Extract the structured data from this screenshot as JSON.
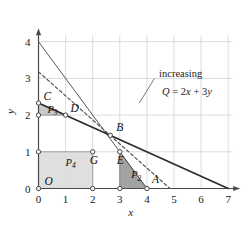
{
  "figure": {
    "kind": "linear-programming-feasible-region",
    "background_color": "#ffffff",
    "grid_color": "#c8cfd6",
    "line_color": "#3d3d3d",
    "dashed_color": "#4a4a4a"
  },
  "axes": {
    "x_label": "x",
    "y_label": "y",
    "x_ticks": [
      "0",
      "1",
      "2",
      "3",
      "4",
      "5",
      "6",
      "7"
    ],
    "y_ticks": [
      "0",
      "1",
      "2",
      "3",
      "4"
    ],
    "xlim": [
      0,
      7.25
    ],
    "ylim": [
      0,
      4.25
    ]
  },
  "points": [
    {
      "name": "O",
      "label": "O",
      "x": 0,
      "y": 0,
      "label_dx": 6,
      "label_dy": -4
    },
    {
      "name": "A",
      "label": "A",
      "x": 4,
      "y": 0,
      "label_dx": 5,
      "label_dy": -6
    },
    {
      "name": "B",
      "label": "B",
      "x": 2.65,
      "y": 1.45,
      "label_dx": 6,
      "label_dy": -4
    },
    {
      "name": "C",
      "label": "C",
      "x": 0,
      "y": 2.33,
      "label_dx": 5,
      "label_dy": -3
    },
    {
      "name": "D",
      "label": "D",
      "x": 1,
      "y": 2,
      "label_dx": 5,
      "label_dy": -3
    },
    {
      "name": "E",
      "label": "E",
      "x": 3,
      "y": 1,
      "label_dx": -3,
      "label_dy": 12
    },
    {
      "name": "G",
      "label": "G",
      "x": 2,
      "y": 1,
      "label_dx": -3,
      "label_dy": 12
    }
  ],
  "vertex_markers": [
    {
      "x": 0,
      "y": 0
    },
    {
      "x": 2,
      "y": 0
    },
    {
      "x": 3,
      "y": 0
    },
    {
      "x": 4,
      "y": 0
    },
    {
      "x": 0,
      "y": 1
    },
    {
      "x": 2,
      "y": 1
    },
    {
      "x": 3,
      "y": 1
    },
    {
      "x": 0,
      "y": 2
    },
    {
      "x": 1,
      "y": 2
    },
    {
      "x": 0,
      "y": 2.33
    },
    {
      "x": 2.65,
      "y": 1.45
    }
  ],
  "regions": [
    {
      "name": "P4",
      "label": "P",
      "subscript": "4",
      "fill": "#d9d9d9",
      "opacity": 0.85,
      "stroke": "#9a9a9a",
      "label_x": 1.0,
      "label_y": 0.62,
      "polygon": [
        [
          0,
          0
        ],
        [
          2,
          0
        ],
        [
          2,
          1
        ],
        [
          0,
          1
        ]
      ]
    },
    {
      "name": "P2",
      "label": "P",
      "subscript": "2",
      "fill": "#9e9e9e",
      "opacity": 0.95,
      "stroke": "#7a7a7a",
      "label_x": 3.42,
      "label_y": 0.28,
      "polygon": [
        [
          3,
          0
        ],
        [
          4,
          0
        ],
        [
          3,
          1
        ]
      ]
    },
    {
      "name": "P3",
      "label": "P",
      "subscript": "3",
      "fill": "#c4c4c4",
      "opacity": 0.9,
      "stroke": "#8f8f8f",
      "label_x": 0.33,
      "label_y": 2.06,
      "polygon": [
        [
          0,
          2
        ],
        [
          1,
          2
        ],
        [
          0,
          2.33
        ]
      ]
    }
  ],
  "lines": [
    {
      "name": "constraint-steep",
      "style": "solid",
      "x1": 0,
      "y1": 4,
      "x2": 4,
      "y2": 0,
      "width": 1.0,
      "color": "#555555"
    },
    {
      "name": "constraint-shallow",
      "style": "solid",
      "x1": 0,
      "y1": 2.33,
      "x2": 7,
      "y2": 0,
      "width": 1.7,
      "color": "#2b2b2b"
    },
    {
      "name": "objective-dashed",
      "style": "dashed",
      "x1": 0,
      "y1": 3.18,
      "x2": 4.85,
      "y2": 0,
      "width": 1.1,
      "color": "#4a4a4a"
    }
  ],
  "annotation": {
    "text_line1": "increasing",
    "text_line2_prefix": "Q",
    "text_line2_equals": " = 2",
    "text_line2_x": "x",
    "text_line2_plus": " + 3",
    "text_line2_y": "y",
    "text_x": 4.45,
    "text_y1": 3.05,
    "text_y2": 2.55,
    "leader": {
      "x1": 3.72,
      "y1": 2.33,
      "x2": 4.28,
      "y2": 3.0
    }
  }
}
